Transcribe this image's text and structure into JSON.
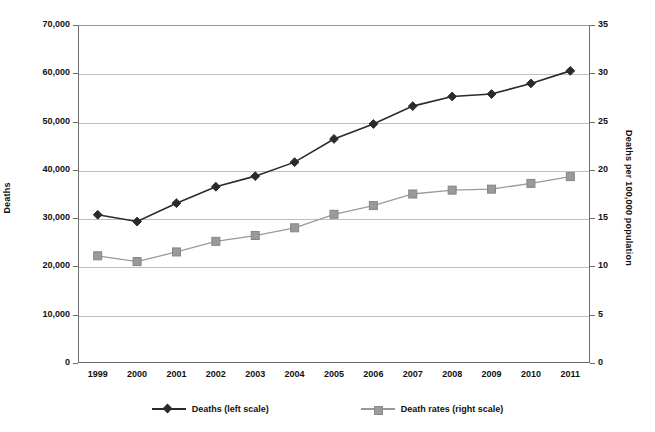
{
  "chart_data": {
    "type": "line",
    "title": "",
    "xlabel": "",
    "ylabel": "Deaths",
    "y2label": "Deaths per 100,000 population",
    "categories": [
      "1999",
      "2000",
      "2001",
      "2002",
      "2003",
      "2004",
      "2005",
      "2006",
      "2007",
      "2008",
      "2009",
      "2010",
      "2011"
    ],
    "ylim": [
      0,
      70000
    ],
    "y2lim": [
      0,
      35
    ],
    "yticks": [
      "0",
      "10,000",
      "20,000",
      "30,000",
      "40,000",
      "50,000",
      "60,000",
      "70,000"
    ],
    "ytick_values": [
      0,
      10000,
      20000,
      30000,
      40000,
      50000,
      60000,
      70000
    ],
    "y2ticks": [
      "0",
      "5",
      "10",
      "15",
      "20",
      "25",
      "30",
      "35"
    ],
    "y2tick_values": [
      0,
      5,
      10,
      15,
      20,
      25,
      30,
      35
    ],
    "grid": true,
    "legend_position": "bottom",
    "series": [
      {
        "name": "Deaths (left scale)",
        "axis": "left",
        "marker": "diamond",
        "color": "#2b2b2b",
        "values": [
          30700,
          29300,
          33100,
          36500,
          38700,
          41600,
          46400,
          49500,
          53200,
          55200,
          55700,
          57900,
          60500
        ]
      },
      {
        "name": "Death rates (right scale)",
        "axis": "right",
        "marker": "square",
        "color": "#9a9a9a",
        "values": [
          11.1,
          10.5,
          11.5,
          12.6,
          13.2,
          14.0,
          15.4,
          16.3,
          17.5,
          17.9,
          18.0,
          18.6,
          19.3
        ]
      }
    ]
  },
  "axes": {
    "left_title": "Deaths",
    "right_title": "Deaths per 100,000 population"
  },
  "legend": {
    "items": [
      {
        "label": "Deaths (left scale)",
        "marker": "diamond",
        "color": "#2b2b2b"
      },
      {
        "label": "Death rates (right scale)",
        "marker": "square",
        "color": "#9a9a9a"
      }
    ]
  },
  "colors": {
    "series_primary": "#2b2b2b",
    "series_secondary": "#9a9a9a",
    "gridline": "#bfbfbf",
    "axis": "#6e6e6e",
    "background": "#ffffff"
  }
}
